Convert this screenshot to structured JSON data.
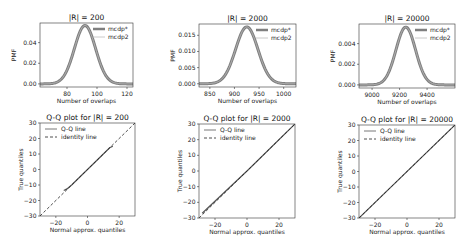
{
  "chart_data": [
    {
      "type": "line",
      "title": "|R| = 200",
      "xlabel": "Number of overlaps",
      "ylabel": "PMF",
      "xlim": [
        62,
        124
      ],
      "ylim": [
        -0.003,
        0.059
      ],
      "xticks": [
        80,
        100,
        120
      ],
      "yticks": [
        0.0,
        0.02,
        0.04
      ],
      "ytick_labels": [
        "0.00",
        "0.02",
        "0.04"
      ],
      "legend": [
        "mcdp*",
        "mcdp2"
      ],
      "legend_position": "upper right",
      "series": [
        {
          "name": "mcdp*",
          "dist": "normal",
          "mean": 92,
          "peak": 0.0566,
          "std": 7.05
        },
        {
          "name": "mcdp2",
          "dist": "normal",
          "mean": 92,
          "peak": 0.0566,
          "std": 7.05
        }
      ]
    },
    {
      "type": "line",
      "title": "|R| = 2000",
      "xlabel": "Number of overlaps",
      "ylabel": "PMF",
      "xlim": [
        828,
        1025
      ],
      "ylim": [
        -0.001,
        0.0185
      ],
      "xticks": [
        850,
        900,
        950,
        1000
      ],
      "yticks": [
        0.0,
        0.005,
        0.01,
        0.015
      ],
      "ytick_labels": [
        "0.000",
        "0.005",
        "0.010",
        "0.015"
      ],
      "legend": [
        "mcdp*",
        "mcdp2"
      ],
      "legend_position": "upper right",
      "series": [
        {
          "name": "mcdp*",
          "dist": "normal",
          "mean": 925,
          "peak": 0.0176,
          "std": 22.7
        },
        {
          "name": "mcdp2",
          "dist": "normal",
          "mean": 925,
          "peak": 0.0176,
          "std": 22.7
        }
      ]
    },
    {
      "type": "line",
      "title": "|R| = 20000",
      "xlabel": "Number of overlaps",
      "ylabel": "PMF",
      "xlim": [
        8905,
        9603
      ],
      "ylim": [
        -0.0003,
        0.0059
      ],
      "xticks": [
        9000,
        9200,
        9400
      ],
      "yticks": [
        0.0,
        0.002,
        0.004
      ],
      "ytick_labels": [
        "0.000",
        "0.002",
        "0.004"
      ],
      "legend": [
        "mcdp*",
        "mcdp2"
      ],
      "legend_position": "upper right",
      "series": [
        {
          "name": "mcdp*",
          "dist": "normal",
          "mean": 9245,
          "peak": 0.0056,
          "std": 71.2
        },
        {
          "name": "mcdp2",
          "dist": "normal",
          "mean": 9245,
          "peak": 0.0056,
          "std": 71.2
        }
      ]
    },
    {
      "type": "line",
      "title": "Q-Q plot for |R| = 200",
      "xlabel": "Normal approx. quantiles",
      "ylabel": "True quantiles",
      "xlim": [
        -30,
        30
      ],
      "ylim": [
        -30,
        30
      ],
      "xticks": [
        -20,
        0,
        20
      ],
      "yticks": [
        -30,
        -20,
        -10,
        0,
        10,
        20,
        30
      ],
      "legend": [
        "Q-Q line",
        "identity line"
      ],
      "legend_position": "upper left",
      "series": [
        {
          "name": "Q-Q line",
          "x": [
            -15,
            -13,
            -10,
            0,
            10,
            14,
            16
          ],
          "y": [
            -13.5,
            -12.5,
            -10,
            0,
            10,
            14,
            15
          ]
        },
        {
          "name": "identity line",
          "x": [
            -30,
            30
          ],
          "y": [
            -30,
            30
          ]
        }
      ]
    },
    {
      "type": "line",
      "title": "Q-Q plot for |R| = 2000",
      "xlabel": "Normal approx. quantiles",
      "ylabel": "True quantiles",
      "xlim": [
        -30,
        30
      ],
      "ylim": [
        -30,
        30
      ],
      "xticks": [
        -20,
        0,
        20
      ],
      "yticks": [
        -30,
        -20,
        -10,
        0,
        10,
        20,
        30
      ],
      "legend": [
        "Q-Q line",
        "identity line"
      ],
      "legend_position": "upper left",
      "series": [
        {
          "name": "Q-Q line",
          "x": [
            -28,
            0,
            30
          ],
          "y": [
            -27,
            0,
            30
          ]
        },
        {
          "name": "identity line",
          "x": [
            -30,
            30
          ],
          "y": [
            -30,
            30
          ]
        }
      ]
    },
    {
      "type": "line",
      "title": "Q-Q plot for |R| = 20000",
      "xlabel": "Normal approx. quantiles",
      "ylabel": "True quantiles",
      "xlim": [
        -30,
        30
      ],
      "ylim": [
        -30,
        30
      ],
      "xticks": [
        -20,
        0,
        20
      ],
      "yticks": [
        -30,
        -20,
        -10,
        0,
        10,
        20,
        30
      ],
      "legend": [
        "Q-Q line",
        "identity line"
      ],
      "legend_position": "upper left",
      "series": [
        {
          "name": "Q-Q line",
          "x": [
            -30,
            30
          ],
          "y": [
            -30,
            30
          ]
        },
        {
          "name": "identity line",
          "x": [
            -30,
            30
          ],
          "y": [
            -30,
            30
          ]
        }
      ]
    }
  ],
  "layout": {
    "boxes": [
      {
        "x": 40,
        "y": 23,
        "w": 93,
        "h": 64
      },
      {
        "x": 199,
        "y": 24,
        "w": 97,
        "h": 63
      },
      {
        "x": 359,
        "y": 24,
        "w": 96,
        "h": 64
      },
      {
        "x": 40,
        "y": 123,
        "w": 95,
        "h": 93
      },
      {
        "x": 199,
        "y": 124,
        "w": 96,
        "h": 94
      },
      {
        "x": 359,
        "y": 125,
        "w": 96,
        "h": 93
      }
    ],
    "colors": {
      "pmf_main": "#7f7f7f",
      "pmf_second": "#bdbdbd",
      "qq": "#555555",
      "identity": "#222222",
      "axis": "#333333"
    }
  }
}
